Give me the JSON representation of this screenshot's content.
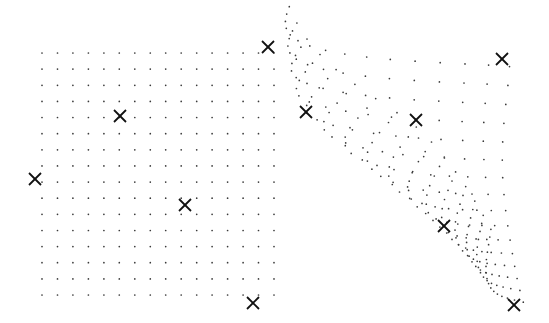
{
  "figure": {
    "colors": {
      "dot": "#3a3a3a",
      "marker": "#111111",
      "background": "#ffffff"
    },
    "source_grid": {
      "cols": 16,
      "rows": 16,
      "x_start": 42,
      "x_end": 274,
      "y_start": 53,
      "y_end": 295
    },
    "source_control_points": [
      {
        "x": 268,
        "y": 47
      },
      {
        "x": 120,
        "y": 116
      },
      {
        "x": 35,
        "y": 179
      },
      {
        "x": 185,
        "y": 205
      },
      {
        "x": 253,
        "y": 303
      }
    ],
    "target_control_points": [
      {
        "x": 502,
        "y": 59
      },
      {
        "x": 306,
        "y": 112
      },
      {
        "x": 416,
        "y": 120
      },
      {
        "x": 444,
        "y": 226
      },
      {
        "x": 514,
        "y": 305
      }
    ],
    "marker_icon": "x-mark",
    "marker_size": 6
  }
}
